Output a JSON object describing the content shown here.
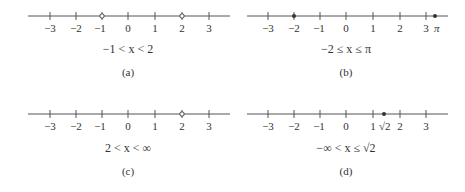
{
  "figure": {
    "ticks": [
      "−3",
      "−2",
      "−1",
      "0",
      "1",
      "2",
      "3"
    ],
    "panels": [
      {
        "id": "a",
        "caption": "(a)",
        "inequality": "−1 < x < 2",
        "left_endpoint": {
          "value": -1,
          "type": "open"
        },
        "right_endpoint": {
          "value": 2,
          "type": "open"
        }
      },
      {
        "id": "b",
        "caption": "(b)",
        "inequality": "−2 ≤ x ≤ π",
        "left_endpoint": {
          "value": -2,
          "type": "closed"
        },
        "right_endpoint": {
          "value": 3.14159,
          "type": "closed",
          "label": "π"
        }
      },
      {
        "id": "c",
        "caption": "(c)",
        "inequality": "2 < x < ∞",
        "left_endpoint": {
          "value": 2,
          "type": "open"
        },
        "right_endpoint": {
          "value": "∞",
          "type": "none"
        }
      },
      {
        "id": "d",
        "caption": "(d)",
        "inequality": "−∞ < x ≤ √2",
        "left_endpoint": {
          "value": "−∞",
          "type": "none"
        },
        "right_endpoint": {
          "value": 1.41421,
          "type": "closed",
          "label": "√2"
        }
      }
    ]
  },
  "colors": {
    "line": "#555555",
    "text": "#333333",
    "open_fill": "#ffffff",
    "closed_fill": "#333333"
  }
}
